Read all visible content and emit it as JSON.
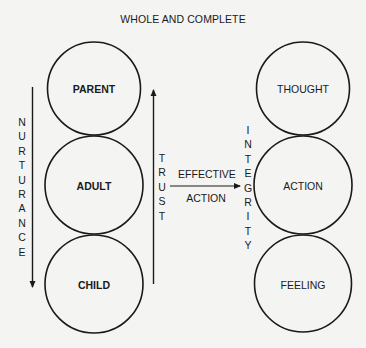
{
  "title": "WHOLE AND COMPLETE",
  "left_column": {
    "circles": [
      {
        "label": "PARENT"
      },
      {
        "label": "ADULT"
      },
      {
        "label": "CHILD"
      }
    ]
  },
  "right_column": {
    "circles": [
      {
        "label": "THOUGHT"
      },
      {
        "label": "ACTION"
      },
      {
        "label": "FEELING"
      }
    ]
  },
  "arrows": {
    "nurturance": {
      "label": "NURTURANCE",
      "direction": "down"
    },
    "trust": {
      "label": "TRUST",
      "direction": "up"
    },
    "effective_action": {
      "label_top": "EFFECTIVE",
      "label_bottom": "ACTION",
      "direction": "right"
    },
    "integrity": {
      "label": "INTEGRITY"
    }
  },
  "colors": {
    "stroke": "#1a1a1a",
    "background": "#f4f4f2"
  }
}
